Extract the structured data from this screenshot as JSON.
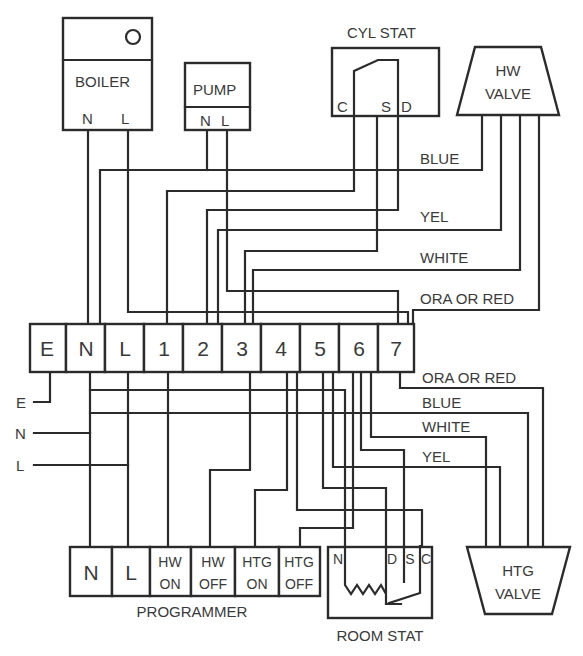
{
  "diagram": {
    "type": "wiring-diagram",
    "components": {
      "boiler": {
        "label": "BOILER",
        "terminals": [
          "N",
          "L"
        ],
        "icon": "indicator-light-icon"
      },
      "pump": {
        "label": "PUMP",
        "terminals": [
          "N",
          "L"
        ]
      },
      "cyl_stat": {
        "label": "CYL STAT",
        "terminals": [
          "C",
          "S",
          "D"
        ]
      },
      "hw_valve": {
        "label_line1": "HW",
        "label_line2": "VALVE"
      },
      "htg_valve": {
        "label_line1": "HTG",
        "label_line2": "VALVE"
      },
      "programmer": {
        "label": "PROGRAMMER",
        "terminals": [
          {
            "line1": "N",
            "line2": ""
          },
          {
            "line1": "L",
            "line2": ""
          },
          {
            "line1": "HW",
            "line2": "ON"
          },
          {
            "line1": "HW",
            "line2": "OFF"
          },
          {
            "line1": "HTG",
            "line2": "ON"
          },
          {
            "line1": "HTG",
            "line2": "OFF"
          }
        ]
      },
      "room_stat": {
        "label": "ROOM STAT",
        "terminals": [
          "N",
          "D",
          "S",
          "C"
        ]
      },
      "junction_box": {
        "terminals": [
          "E",
          "N",
          "L",
          "1",
          "2",
          "3",
          "4",
          "5",
          "6",
          "7"
        ]
      }
    },
    "supply": {
      "labels": [
        "E",
        "N",
        "L"
      ]
    },
    "wire_labels_top": [
      "BLUE",
      "YEL",
      "WHITE",
      "ORA OR RED"
    ],
    "wire_labels_bottom": [
      "ORA OR RED",
      "BLUE",
      "WHITE",
      "YEL"
    ],
    "colors": {
      "line": "#2b2b2b",
      "text": "#3a3a3a",
      "background": "#ffffff"
    }
  }
}
